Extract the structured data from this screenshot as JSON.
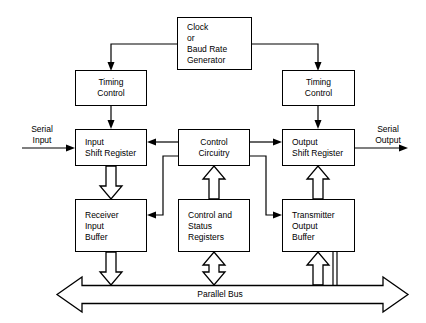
{
  "diagram": {
    "boxes": {
      "clock": {
        "label": "Clock\nor\nBaud Rate\nGenerator"
      },
      "timing_control_left": {
        "label": "Timing\nControl"
      },
      "timing_control_right": {
        "label": "Timing\nControl"
      },
      "input_shift_register": {
        "label": "Input\nShift Register"
      },
      "control_circuitry": {
        "label": "Control\nCircuitry"
      },
      "output_shift_register": {
        "label": "Output\nShift Register"
      },
      "receiver_input_buffer": {
        "label": "Receiver\nInput\nBuffer"
      },
      "control_status_registers": {
        "label": "Control and\nStatus\nRegisters"
      },
      "transmitter_output_buffer": {
        "label": "Transmitter\nOutput\nBuffer"
      }
    },
    "labels": {
      "serial_input": "Serial\nInput",
      "serial_output": "Serial\nOutput",
      "parallel_bus": "Parallel Bus"
    },
    "colors": {
      "line": "#000000",
      "background": "#ffffff",
      "fill": "#ffffff"
    }
  }
}
